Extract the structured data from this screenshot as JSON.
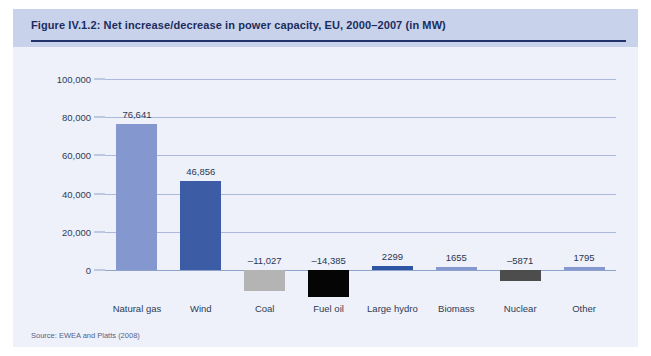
{
  "figure": {
    "title": "Figure IV.1.2: Net increase/decrease in power capacity, EU, 2000–2007 (in MW)",
    "source": "Source: EWEA and Platts (2008)"
  },
  "chart_data": {
    "type": "bar",
    "title": "Figure IV.1.2: Net increase/decrease in power capacity, EU, 2000–2007 (in MW)",
    "xlabel": "",
    "ylabel": "",
    "ylim": [
      -20000,
      100000
    ],
    "grid": true,
    "legend": "none",
    "categories": [
      "Natural gas",
      "Wind",
      "Coal",
      "Fuel oil",
      "Large hydro",
      "Biomass",
      "Nuclear",
      "Other"
    ],
    "values": [
      76641,
      46856,
      -11027,
      -14385,
      2299,
      1655,
      -5871,
      1795
    ],
    "value_labels": [
      "76,641",
      "46,856",
      "–11,027",
      "–14,385",
      "2299",
      "1655",
      "–5871",
      "1795"
    ],
    "bar_colors": [
      "#8497cf",
      "#3c5da5",
      "#b4b4b4",
      "#050505",
      "#2e54a4",
      "#8497cf",
      "#4d4d4d",
      "#8497cf"
    ],
    "y_ticks": [
      0,
      20000,
      40000,
      60000,
      80000,
      100000
    ],
    "y_tick_labels": [
      "0",
      "20,000",
      "40,000",
      "60,000",
      "80,000",
      "100,000"
    ]
  },
  "colors": {
    "panel_background": "#eef1f9",
    "header_background": "#c8d2ea",
    "header_rule": "#23336b",
    "title_text": "#1b2d5e",
    "gridline": "#aab9dc"
  }
}
